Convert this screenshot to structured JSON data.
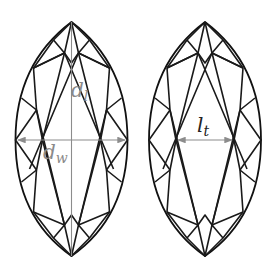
{
  "diagram": {
    "left_gem": {
      "shape": "marquise",
      "labels": {
        "length": {
          "main": "d",
          "sub": "l"
        },
        "width": {
          "main": "d",
          "sub": "w"
        }
      },
      "dimension_lines": [
        "length (vertical, top tip to bottom tip)",
        "width (horizontal, arrowed)"
      ]
    },
    "right_gem": {
      "shape": "marquise",
      "labels": {
        "table": {
          "main": "l",
          "sub": "t"
        }
      },
      "dimension_lines": [
        "table width (horizontal, arrowed)"
      ]
    },
    "colors": {
      "outline": "#111111",
      "dimension": "#8c8c8c",
      "label_gray": "#8a8a8a",
      "label_dark": "#222222",
      "background": "#ffffff"
    }
  }
}
